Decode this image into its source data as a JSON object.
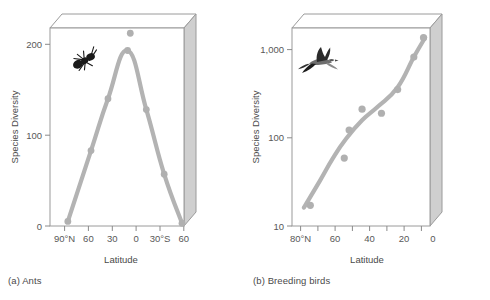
{
  "figure": {
    "panels": [
      {
        "id": "a",
        "caption": "(a) Ants",
        "icon": "ant-icon",
        "ylabel": "Species Diversity",
        "xlabel": "Latitude"
      },
      {
        "id": "b",
        "caption": "(b) Breeding birds",
        "icon": "bird-icon",
        "ylabel": "Species Diversity",
        "xlabel": "Latitude"
      }
    ]
  },
  "colors": {
    "curve": "#b3b3b3",
    "point": "#b0b0b0",
    "frame": "#9a9a9a",
    "text": "#4a4a4a",
    "tick_text": "#585858",
    "box_side": "#cfcfcf",
    "background": "#ffffff"
  },
  "chart_data": [
    {
      "type": "line",
      "title": "(a) Ants",
      "xlabel": "Latitude",
      "ylabel": "Species Diversity",
      "xticklabels": [
        "90°N",
        "60",
        "30",
        "0",
        "30°S",
        "60"
      ],
      "xtickvalues": [
        90,
        60,
        30,
        0,
        -30,
        -60
      ],
      "yticklabels": [
        "0",
        "100",
        "200"
      ],
      "ytickvalues": [
        0,
        100,
        200
      ],
      "ylim": [
        0,
        215
      ],
      "xlim": [
        90,
        -60
      ],
      "yscale": "linear",
      "grid": false,
      "legend": false,
      "series": [
        {
          "name": "Ant species diversity",
          "points": [
            {
              "latitude": 70,
              "value": 5
            },
            {
              "latitude": 44,
              "value": 83
            },
            {
              "latitude": 25,
              "value": 140
            },
            {
              "latitude": 3,
              "value": 193
            },
            {
              "latitude": -18,
              "value": 128
            },
            {
              "latitude": -38,
              "value": 57
            },
            {
              "latitude": -58,
              "value": 3
            }
          ]
        }
      ],
      "outlier_points": [
        {
          "latitude": 0,
          "value": 212,
          "note": "point plotted above plot frame"
        }
      ]
    },
    {
      "type": "scatter",
      "title": "(b) Breeding birds",
      "xlabel": "Latitude",
      "ylabel": "Species Diversity",
      "xticklabels": [
        "80°N",
        "60",
        "40",
        "20",
        "0"
      ],
      "xtickvalues": [
        80,
        60,
        40,
        20,
        0
      ],
      "yticklabels": [
        "10",
        "100",
        "1,000"
      ],
      "ytickvalues": [
        10,
        100,
        1000
      ],
      "ylim": [
        10,
        1600
      ],
      "xlim": [
        80,
        0
      ],
      "yscale": "log",
      "grid": false,
      "legend": false,
      "series": [
        {
          "name": "Breeding bird species diversity",
          "points": [
            {
              "latitude": 74,
              "value": 17
            },
            {
              "latitude": 53,
              "value": 57
            },
            {
              "latitude": 50,
              "value": 117
            },
            {
              "latitude": 42,
              "value": 200
            },
            {
              "latitude": 30,
              "value": 180
            },
            {
              "latitude": 20,
              "value": 330
            },
            {
              "latitude": 10,
              "value": 760
            },
            {
              "latitude": 4,
              "value": 1250
            }
          ]
        }
      ],
      "trend": {
        "name": "fitted trend line",
        "points": [
          {
            "latitude": 78,
            "value": 16
          },
          {
            "latitude": 68,
            "value": 32
          },
          {
            "latitude": 60,
            "value": 57
          },
          {
            "latitude": 52,
            "value": 93
          },
          {
            "latitude": 42,
            "value": 150
          },
          {
            "latitude": 32,
            "value": 215
          },
          {
            "latitude": 20,
            "value": 350
          },
          {
            "latitude": 10,
            "value": 760
          },
          {
            "latitude": 3,
            "value": 1250
          }
        ]
      }
    }
  ]
}
